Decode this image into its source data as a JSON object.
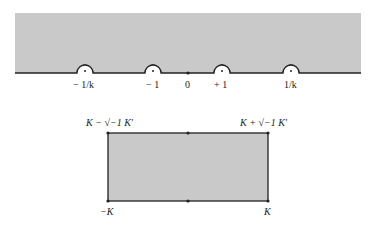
{
  "upper_half_plane": {
    "fill_color": "#c9c9c9",
    "line_color": "#222222",
    "points": [
      {
        "id": "neg-inv-k",
        "label": "− 1/k",
        "x": 85,
        "indented": true
      },
      {
        "id": "neg-one",
        "label": "− 1",
        "x": 153,
        "indented": true
      },
      {
        "id": "zero",
        "label": "0",
        "x": 188,
        "indented": false
      },
      {
        "id": "pos-one",
        "label": "+ 1",
        "x": 222,
        "indented": true
      },
      {
        "id": "inv-k",
        "label": "1/k",
        "x": 291,
        "indented": true
      }
    ]
  },
  "rectangle": {
    "fill_color": "#c9c9c9",
    "line_color": "#222222",
    "corners": {
      "top_left": "K − √−1 K′",
      "top_right": "K + √−1 K′",
      "bottom_left": "−K",
      "bottom_right": "K"
    }
  }
}
